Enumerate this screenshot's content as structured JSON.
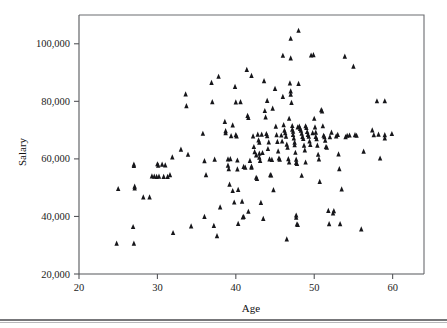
{
  "chart_data": {
    "type": "scatter",
    "title": "",
    "xlabel": "Age",
    "ylabel": "Salary",
    "xlim": [
      20,
      64
    ],
    "ylim": [
      20000,
      110000
    ],
    "xticks": [
      20,
      30,
      40,
      50,
      60
    ],
    "xtick_labels": [
      "20",
      "30",
      "40",
      "50",
      "60"
    ],
    "yticks": [
      20000,
      40000,
      60000,
      80000,
      100000
    ],
    "ytick_labels": [
      "20,000",
      "40,000",
      "60,000",
      "80,000",
      "100,000"
    ],
    "grid": false,
    "legend": null,
    "marker": "triangle-up",
    "marker_color": "#16161a",
    "marker_size": 4,
    "n_points": 214,
    "points": [
      [
        25.0,
        49500
      ],
      [
        24.8,
        30500
      ],
      [
        26.9,
        36300
      ],
      [
        27.0,
        58000
      ],
      [
        27.0,
        57500
      ],
      [
        27.1,
        50300
      ],
      [
        27.1,
        49700
      ],
      [
        27.0,
        30500
      ],
      [
        28.2,
        46600
      ],
      [
        29.0,
        46600
      ],
      [
        29.3,
        53900
      ],
      [
        29.6,
        53800
      ],
      [
        29.9,
        53700
      ],
      [
        30.2,
        53800
      ],
      [
        30.0,
        58100
      ],
      [
        30.1,
        57600
      ],
      [
        30.6,
        58000
      ],
      [
        30.8,
        53700
      ],
      [
        31.0,
        57700
      ],
      [
        31.3,
        53700
      ],
      [
        31.6,
        54300
      ],
      [
        31.9,
        60500
      ],
      [
        32.0,
        34200
      ],
      [
        33.0,
        63200
      ],
      [
        33.6,
        82400
      ],
      [
        33.7,
        78300
      ],
      [
        33.9,
        61400
      ],
      [
        34.3,
        36500
      ],
      [
        35.8,
        68700
      ],
      [
        36.0,
        59200
      ],
      [
        36.2,
        54300
      ],
      [
        36.0,
        39800
      ],
      [
        36.9,
        86400
      ],
      [
        37.0,
        79700
      ],
      [
        37.3,
        59700
      ],
      [
        37.2,
        36700
      ],
      [
        37.6,
        33100
      ],
      [
        37.8,
        88500
      ],
      [
        38.0,
        43100
      ],
      [
        38.6,
        72800
      ],
      [
        38.7,
        69600
      ],
      [
        38.7,
        68900
      ],
      [
        39.0,
        59800
      ],
      [
        39.0,
        57600
      ],
      [
        39.1,
        56400
      ],
      [
        39.2,
        51000
      ],
      [
        39.3,
        59900
      ],
      [
        39.6,
        71600
      ],
      [
        39.6,
        48800
      ],
      [
        39.8,
        44800
      ],
      [
        39.9,
        85000
      ],
      [
        40.0,
        79600
      ],
      [
        40.0,
        68200
      ],
      [
        40.1,
        67800
      ],
      [
        40.2,
        59400
      ],
      [
        40.2,
        56300
      ],
      [
        40.3,
        49200
      ],
      [
        40.3,
        37400
      ],
      [
        40.6,
        79700
      ],
      [
        40.8,
        45100
      ],
      [
        40.9,
        39600
      ],
      [
        41.0,
        39800
      ],
      [
        41.0,
        57200
      ],
      [
        41.2,
        56900
      ],
      [
        41.4,
        90900
      ],
      [
        41.5,
        74900
      ],
      [
        41.6,
        74200
      ],
      [
        41.6,
        41600
      ],
      [
        42.0,
        88800
      ],
      [
        42.0,
        57300
      ],
      [
        42.0,
        56900
      ],
      [
        42.3,
        64100
      ],
      [
        42.4,
        62300
      ],
      [
        42.6,
        53400
      ],
      [
        42.7,
        53000
      ],
      [
        42.8,
        68400
      ],
      [
        42.9,
        66400
      ],
      [
        43.0,
        65600
      ],
      [
        43.0,
        61800
      ],
      [
        43.0,
        60400
      ],
      [
        43.1,
        59300
      ],
      [
        43.2,
        44700
      ],
      [
        43.5,
        39100
      ],
      [
        43.6,
        87000
      ],
      [
        43.7,
        76600
      ],
      [
        43.8,
        74400
      ],
      [
        43.9,
        68600
      ],
      [
        44.0,
        80100
      ],
      [
        44.0,
        67900
      ],
      [
        44.1,
        63400
      ],
      [
        44.3,
        59800
      ],
      [
        44.4,
        54300
      ],
      [
        44.5,
        54200
      ],
      [
        44.8,
        49100
      ],
      [
        45.0,
        84300
      ],
      [
        45.1,
        71200
      ],
      [
        45.2,
        68200
      ],
      [
        45.3,
        65900
      ],
      [
        45.4,
        62600
      ],
      [
        45.5,
        60100
      ],
      [
        45.8,
        68100
      ],
      [
        46.0,
        95800
      ],
      [
        46.0,
        81500
      ],
      [
        46.1,
        71700
      ],
      [
        46.2,
        69800
      ],
      [
        46.3,
        68900
      ],
      [
        46.4,
        67700
      ],
      [
        46.5,
        64900
      ],
      [
        46.6,
        63900
      ],
      [
        46.7,
        59900
      ],
      [
        46.8,
        58700
      ],
      [
        46.5,
        32000
      ],
      [
        47.0,
        101700
      ],
      [
        47.0,
        94900
      ],
      [
        47.0,
        83400
      ],
      [
        47.0,
        82300
      ],
      [
        47.1,
        79400
      ],
      [
        47.2,
        71400
      ],
      [
        47.2,
        70100
      ],
      [
        47.3,
        69400
      ],
      [
        47.3,
        68300
      ],
      [
        47.4,
        67100
      ],
      [
        47.5,
        65600
      ],
      [
        47.5,
        64700
      ],
      [
        47.6,
        62100
      ],
      [
        47.7,
        59700
      ],
      [
        47.7,
        58600
      ],
      [
        47.8,
        58200
      ],
      [
        47.7,
        40300
      ],
      [
        47.7,
        39500
      ],
      [
        47.8,
        37200
      ],
      [
        47.9,
        37000
      ],
      [
        48.0,
        104500
      ],
      [
        48.0,
        86000
      ],
      [
        48.1,
        71200
      ],
      [
        48.2,
        70400
      ],
      [
        48.3,
        69800
      ],
      [
        48.4,
        68700
      ],
      [
        48.5,
        67600
      ],
      [
        48.6,
        66900
      ],
      [
        48.7,
        64600
      ],
      [
        48.8,
        62900
      ],
      [
        48.9,
        58700
      ],
      [
        48.4,
        54100
      ],
      [
        49.0,
        70700
      ],
      [
        49.1,
        69300
      ],
      [
        49.2,
        68300
      ],
      [
        49.3,
        67700
      ],
      [
        49.4,
        66000
      ],
      [
        49.5,
        64800
      ],
      [
        49.6,
        95900
      ],
      [
        49.9,
        96000
      ],
      [
        50.0,
        73900
      ],
      [
        50.1,
        70900
      ],
      [
        50.2,
        69100
      ],
      [
        50.2,
        67600
      ],
      [
        50.4,
        64600
      ],
      [
        50.5,
        61400
      ],
      [
        50.6,
        59800
      ],
      [
        50.7,
        52000
      ],
      [
        50.9,
        76900
      ],
      [
        51.0,
        76500
      ],
      [
        51.1,
        71300
      ],
      [
        51.2,
        68000
      ],
      [
        51.3,
        67500
      ],
      [
        51.4,
        66300
      ],
      [
        51.5,
        64100
      ],
      [
        51.6,
        63900
      ],
      [
        51.8,
        41900
      ],
      [
        51.9,
        37300
      ],
      [
        52.0,
        67500
      ],
      [
        52.2,
        69100
      ],
      [
        52.4,
        41000
      ],
      [
        52.5,
        41800
      ],
      [
        52.8,
        67800
      ],
      [
        53.0,
        68300
      ],
      [
        53.1,
        61500
      ],
      [
        53.2,
        56400
      ],
      [
        53.3,
        37300
      ],
      [
        53.5,
        49400
      ],
      [
        53.9,
        95500
      ],
      [
        54.0,
        67500
      ],
      [
        54.2,
        68000
      ],
      [
        54.5,
        68100
      ],
      [
        55.0,
        92000
      ],
      [
        55.2,
        68200
      ],
      [
        55.4,
        68000
      ],
      [
        56.0,
        35500
      ],
      [
        56.3,
        62500
      ],
      [
        57.4,
        69900
      ],
      [
        57.6,
        68200
      ],
      [
        58.0,
        80000
      ],
      [
        58.2,
        68400
      ],
      [
        58.4,
        60100
      ],
      [
        59.0,
        80000
      ],
      [
        59.0,
        68200
      ],
      [
        59.0,
        67100
      ],
      [
        59.9,
        68600
      ],
      [
        43.3,
        68400
      ],
      [
        44.7,
        77400
      ],
      [
        46.9,
        86200
      ],
      [
        45.6,
        59700
      ],
      [
        41.8,
        59300
      ],
      [
        39.4,
        67900
      ],
      [
        42.2,
        67800
      ],
      [
        43.4,
        62000
      ],
      [
        44.2,
        65700
      ],
      [
        45.9,
        66000
      ],
      [
        47.9,
        70900
      ],
      [
        49.8,
        68900
      ],
      [
        50.3,
        66800
      ],
      [
        48.9,
        71300
      ],
      [
        46.8,
        73900
      ],
      [
        44.6,
        59600
      ],
      [
        42.6,
        61200
      ]
    ]
  },
  "axes": {
    "x_axis_name": "Age",
    "y_axis_name": "Salary"
  },
  "footer": {
    "rule_visible": "true"
  }
}
